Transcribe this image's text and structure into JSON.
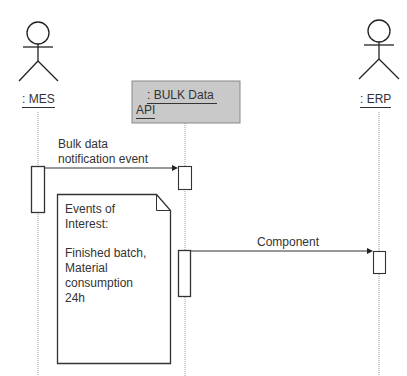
{
  "diagram": {
    "type": "sequence",
    "participants": [
      {
        "id": "mes",
        "label": ": MES",
        "kind": "actor"
      },
      {
        "id": "api",
        "label_line1": ": BULK Data",
        "label_line2": "API",
        "kind": "object",
        "fill": "#c9c9c9"
      },
      {
        "id": "erp",
        "label": ": ERP",
        "kind": "actor"
      }
    ],
    "messages": [
      {
        "from": "mes",
        "to": "api",
        "label_line1": "Bulk data",
        "label_line2": "notification event"
      },
      {
        "from": "api",
        "to": "erp",
        "label": "Component"
      }
    ],
    "note": {
      "line1": "Events of",
      "line2": "Interest:",
      "line3": "Finished batch,",
      "line4": "Material",
      "line5": "consumption",
      "line6": "24h"
    }
  }
}
